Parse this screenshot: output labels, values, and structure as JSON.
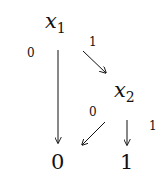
{
  "diagram": {
    "type": "binary-decision-diagram",
    "nodes": [
      {
        "id": "x1",
        "base": "x",
        "sub": "1"
      },
      {
        "id": "x2",
        "base": "x",
        "sub": "2"
      },
      {
        "id": "leaf0",
        "label": "0"
      },
      {
        "id": "leaf1",
        "label": "1"
      }
    ],
    "edges": [
      {
        "from": "x1",
        "to": "leaf0",
        "label": "0"
      },
      {
        "from": "x1",
        "to": "x2",
        "label": "1"
      },
      {
        "from": "x2",
        "to": "leaf0",
        "label": "0"
      },
      {
        "from": "x2",
        "to": "leaf1",
        "label": "1"
      }
    ]
  }
}
